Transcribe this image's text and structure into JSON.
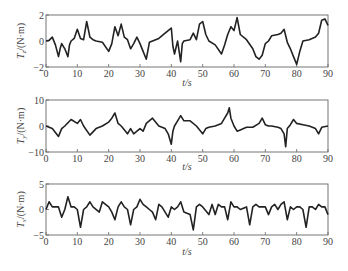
{
  "chart_data": [
    {
      "type": "line",
      "title": "",
      "xlabel": "t / s",
      "ylabel": "T_z / (N·m)",
      "ylabel_main": "T",
      "ylabel_sub": "z",
      "ylabel_unit": "/(N·m)",
      "xlim": [
        0,
        90
      ],
      "ylim": [
        -2,
        2
      ],
      "xticks": [
        "0",
        "10",
        "20",
        "30",
        "40",
        "50",
        "60",
        "70",
        "80",
        "90"
      ],
      "yticks": [
        "-2",
        "0",
        "2"
      ],
      "grid": false,
      "x": [
        0,
        1,
        2,
        3,
        4,
        4.5,
        5,
        6,
        7,
        7.5,
        8,
        9,
        10,
        11,
        12,
        13,
        14,
        15,
        16,
        18,
        20,
        21,
        22,
        23,
        24,
        25,
        26,
        27,
        28,
        29,
        30,
        31,
        32,
        33,
        34,
        36,
        38,
        39,
        40,
        40.5,
        41,
        42,
        43,
        43.5,
        44,
        46,
        47,
        48,
        49,
        50,
        51,
        52,
        54,
        56,
        57,
        58,
        59,
        60,
        61,
        62,
        64,
        66,
        67,
        68,
        69,
        70,
        71,
        72,
        74,
        75,
        76,
        77,
        78,
        79,
        80,
        81,
        82,
        84,
        86,
        87,
        88,
        89,
        90
      ],
      "values": [
        0,
        0.05,
        0.3,
        -0.3,
        -1.2,
        -0.6,
        -0.2,
        -0.6,
        -1.2,
        -0.3,
        0,
        0.2,
        0.9,
        0.2,
        0.1,
        1.5,
        0.3,
        0.1,
        0,
        -0.1,
        -0.8,
        -0.2,
        1.1,
        0.4,
        1.3,
        0.3,
        0.1,
        -0.6,
        -0.2,
        0.3,
        -0.2,
        -0.8,
        -1.4,
        -0.1,
        0,
        0.2,
        0.6,
        0.8,
        1.0,
        -0.4,
        -1.0,
        0,
        -1.6,
        -0.2,
        0,
        0.1,
        0.6,
        0.1,
        1.3,
        1.5,
        0.5,
        0,
        -0.3,
        -1.0,
        -0.3,
        0.5,
        1.1,
        0.8,
        1.8,
        0.5,
        0.1,
        -0.6,
        -1.2,
        -1.4,
        -1.1,
        -0.2,
        0,
        0.4,
        0.5,
        0.6,
        0.9,
        -0.1,
        -0.6,
        -1.2,
        -1.8,
        -0.8,
        0,
        0.1,
        0.3,
        0.6,
        1.6,
        1.7,
        1.2,
        0.1,
        0
      ]
    },
    {
      "type": "line",
      "title": "",
      "xlabel": "t / s",
      "ylabel": "T_y / (N·m)",
      "ylabel_main": "T",
      "ylabel_sub": "y",
      "ylabel_unit": "/(N·m)",
      "xlim": [
        0,
        90
      ],
      "ylim": [
        -10,
        10
      ],
      "xticks": [
        "0",
        "10",
        "20",
        "30",
        "40",
        "50",
        "60",
        "70",
        "80",
        "90"
      ],
      "yticks": [
        "-10",
        "0",
        "10"
      ],
      "grid": false,
      "x": [
        0,
        2,
        4,
        5,
        6,
        8,
        10,
        11,
        12,
        14,
        16,
        18,
        20,
        21,
        22,
        23,
        24,
        26,
        27,
        28,
        30,
        31,
        32,
        34,
        36,
        38,
        39,
        40,
        40.5,
        41,
        42,
        43,
        44,
        46,
        48,
        50,
        51,
        52,
        54,
        56,
        57,
        58,
        58.5,
        59,
        60,
        61,
        62,
        64,
        66,
        68,
        69,
        70,
        71,
        72,
        74,
        75,
        76,
        76.5,
        77,
        78,
        79,
        80,
        82,
        84,
        86,
        87,
        88,
        90
      ],
      "values": [
        0,
        -1,
        -4,
        -1,
        0,
        2.5,
        1,
        2.5,
        0,
        -3.5,
        -1,
        0,
        1.5,
        3,
        5,
        1,
        0,
        -3,
        -1,
        -3,
        -1,
        -2,
        1,
        3,
        0,
        -1,
        -3,
        -7,
        -2,
        0,
        2,
        4,
        2,
        2,
        0,
        -3,
        -1,
        -0.5,
        0,
        1,
        3,
        5,
        7,
        3,
        0,
        -2,
        -1.5,
        -0.5,
        -0.5,
        1,
        3,
        0.5,
        0,
        0,
        -0.5,
        -1,
        -3,
        -8,
        -1,
        0.5,
        2.5,
        1,
        0.5,
        0,
        -1,
        -3,
        -0.5,
        0
      ]
    },
    {
      "type": "line",
      "title": "",
      "xlabel": "t / s",
      "ylabel": "T_x / (N·m)",
      "ylabel_main": "T",
      "ylabel_sub": "x",
      "ylabel_unit": "/(N·m)",
      "xlim": [
        0,
        90
      ],
      "ylim": [
        -5,
        5
      ],
      "xticks": [
        "0",
        "10",
        "20",
        "30",
        "40",
        "50",
        "60",
        "70",
        "80",
        "90"
      ],
      "yticks": [
        "-5",
        "0",
        "5"
      ],
      "grid": false,
      "x": [
        0,
        1,
        2,
        4,
        5,
        6,
        7,
        8,
        9,
        10,
        11,
        12,
        13,
        14,
        15,
        17,
        18,
        19,
        20,
        21,
        22,
        23,
        24,
        25,
        26,
        27,
        28,
        29,
        30,
        31,
        32,
        33,
        34,
        35,
        36,
        37,
        38,
        39,
        40,
        41,
        42,
        43,
        44,
        46,
        47,
        48,
        49,
        50,
        52,
        53,
        54,
        55,
        56,
        57,
        58,
        59,
        60,
        61,
        62,
        64,
        65,
        66,
        67,
        68,
        70,
        71,
        72,
        73,
        74,
        75,
        76,
        77,
        78,
        79,
        80,
        81,
        82,
        83,
        84,
        85,
        86,
        87,
        88,
        89,
        90
      ],
      "values": [
        0,
        1.5,
        0.5,
        0.5,
        -1.5,
        0,
        2.5,
        0.5,
        0.5,
        0,
        -3.5,
        0,
        0.5,
        1.5,
        0.5,
        -0.5,
        1.5,
        1,
        0.5,
        -0.5,
        -2,
        0.5,
        1.5,
        0.5,
        0,
        -3,
        0,
        0.5,
        2,
        1,
        0.5,
        0,
        -0.5,
        -2,
        1,
        0.5,
        -0.5,
        -1.5,
        0.5,
        0,
        0.5,
        1.5,
        -0.5,
        -1,
        -4,
        0.5,
        1,
        0.5,
        -1,
        1,
        -1,
        1,
        0.5,
        0.5,
        -2,
        1.5,
        0.5,
        0.5,
        0,
        0.5,
        -3,
        0.5,
        1,
        0.5,
        0.5,
        -1,
        0.5,
        1,
        0,
        1,
        1.5,
        -2,
        0.5,
        0,
        0.5,
        0.5,
        0,
        -3.5,
        0.5,
        0.5,
        0,
        1,
        0.5,
        0.5,
        -1
      ]
    }
  ]
}
